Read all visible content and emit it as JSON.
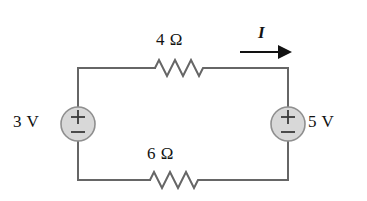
{
  "figure": {
    "kind": "circuit-schematic",
    "background_color": "#ffffff",
    "wire_color": "#666666",
    "ink_color": "#121212",
    "source_fill": "#d8d8d8",
    "source_stroke": "#8f8f8f"
  },
  "labels": {
    "resistor_top": "4 Ω",
    "resistor_bottom": "6 Ω",
    "source_left": "3 V",
    "source_right": "5 V",
    "current": "I"
  },
  "components": [
    {
      "id": "voltage-source-left",
      "type": "independent-voltage-source",
      "label": "3 V",
      "value": 3,
      "unit": "V",
      "polarity_top": "+",
      "polarity_bottom": "−",
      "position": "left-branch"
    },
    {
      "id": "voltage-source-right",
      "type": "independent-voltage-source",
      "label": "5 V",
      "value": 5,
      "unit": "V",
      "polarity_top": "+",
      "polarity_bottom": "−",
      "position": "right-branch"
    },
    {
      "id": "resistor-top",
      "type": "resistor",
      "label": "4 Ω",
      "value": 4,
      "unit": "Ω",
      "position": "top-branch"
    },
    {
      "id": "resistor-bottom",
      "type": "resistor",
      "label": "6 Ω",
      "value": 6,
      "unit": "Ω",
      "position": "bottom-branch"
    }
  ],
  "annotations": [
    {
      "id": "current-arrow",
      "label": "I",
      "direction": "right",
      "on_branch": "top-branch"
    }
  ],
  "polarity_glyphs": {
    "plus": "+",
    "minus": "−"
  }
}
